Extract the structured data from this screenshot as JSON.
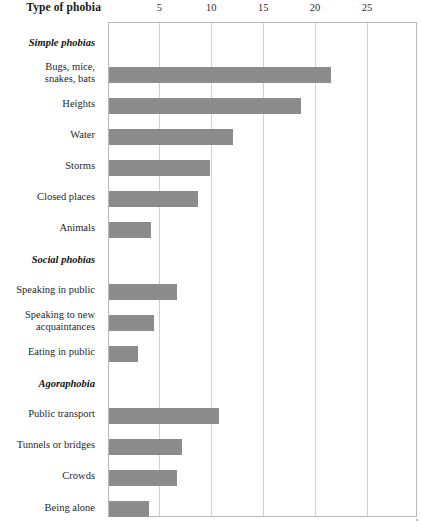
{
  "chart_data": {
    "type": "bar",
    "orientation": "horizontal",
    "title": "Type of phobia",
    "xlabel": "",
    "ylabel": "Type of phobia",
    "xlim": [
      0,
      29.8
    ],
    "ylim": null,
    "grid": true,
    "legend": null,
    "bar_color": "#8c8c8c",
    "axis_ticks": [
      5,
      10,
      15,
      20,
      25
    ],
    "tick_labels": [
      "5",
      "10",
      "15",
      "20",
      "25"
    ],
    "groups": [
      {
        "name": "Simple phobias",
        "categories": [
          "Bugs, mice, snakes, bats",
          "Heights",
          "Water",
          "Storms",
          "Closed places",
          "Animals"
        ],
        "values": [
          21.4,
          18.5,
          12.0,
          9.8,
          8.6,
          4.1
        ]
      },
      {
        "name": "Social phobias",
        "categories": [
          "Speaking in public",
          "Speaking to new acquaintances",
          "Eating in public"
        ],
        "values": [
          6.6,
          4.4,
          2.8
        ]
      },
      {
        "name": "Agoraphobia",
        "categories": [
          "Public transport",
          "Tunnels or bridges",
          "Crowds",
          "Being alone",
          "Going out by oneself"
        ],
        "values": [
          10.6,
          7.1,
          6.6,
          3.9,
          3.6
        ]
      }
    ],
    "categories": [
      "Bugs, mice, snakes, bats",
      "Heights",
      "Water",
      "Storms",
      "Closed places",
      "Animals",
      "Speaking in public",
      "Speaking to new acquaintances",
      "Eating in public",
      "Public transport",
      "Tunnels or bridges",
      "Crowds",
      "Being alone",
      "Going out by oneself"
    ],
    "values": [
      21.4,
      18.5,
      12.0,
      9.8,
      8.6,
      4.1,
      6.6,
      4.4,
      2.8,
      10.6,
      7.1,
      6.6,
      3.9,
      3.6
    ]
  },
  "axis": {
    "title": "Type of phobia",
    "ticks": [
      {
        "label": "5",
        "value": 5
      },
      {
        "label": "10",
        "value": 10
      },
      {
        "label": "15",
        "value": 15
      },
      {
        "label": "20",
        "value": 20
      },
      {
        "label": "25",
        "value": 25
      }
    ]
  },
  "rows": [
    {
      "kind": "group",
      "label": "Simple phobias"
    },
    {
      "kind": "bar",
      "label_lines": [
        "Bugs, mice,",
        "snakes, bats"
      ],
      "value": 21.4
    },
    {
      "kind": "bar",
      "label_lines": [
        "Heights"
      ],
      "value": 18.5
    },
    {
      "kind": "bar",
      "label_lines": [
        "Water"
      ],
      "value": 12.0
    },
    {
      "kind": "bar",
      "label_lines": [
        "Storms"
      ],
      "value": 9.8
    },
    {
      "kind": "bar",
      "label_lines": [
        "Closed places"
      ],
      "value": 8.6
    },
    {
      "kind": "bar",
      "label_lines": [
        "Animals"
      ],
      "value": 4.1
    },
    {
      "kind": "group",
      "label": "Social phobias"
    },
    {
      "kind": "bar",
      "label_lines": [
        "Speaking in public"
      ],
      "value": 6.6
    },
    {
      "kind": "bar",
      "label_lines": [
        "Speaking to new",
        "acquaintances"
      ],
      "value": 4.4
    },
    {
      "kind": "bar",
      "label_lines": [
        "Eating in public"
      ],
      "value": 2.8
    },
    {
      "kind": "group",
      "label": "Agoraphobia"
    },
    {
      "kind": "bar",
      "label_lines": [
        "Public transport"
      ],
      "value": 10.6
    },
    {
      "kind": "bar",
      "label_lines": [
        "Tunnels or bridges"
      ],
      "value": 7.1
    },
    {
      "kind": "bar",
      "label_lines": [
        "Crowds"
      ],
      "value": 6.6
    },
    {
      "kind": "bar",
      "label_lines": [
        "Being alone"
      ],
      "value": 3.9
    },
    {
      "kind": "bar",
      "label_lines": [
        "Going out by oneself"
      ],
      "value": 3.6
    }
  ],
  "layout": {
    "plot_left": 107.5,
    "plot_top": 22,
    "plot_width": 309.5,
    "plot_height": 495,
    "px_per_unit": 10.38,
    "row_pitch": 31.05,
    "first_row_center": 20.5,
    "bar_height": 16
  },
  "colors": {
    "bar": "#8c8c8c",
    "grid": "#cfcfcf",
    "frame": "#b9b9b9",
    "text": "#1a1a1a"
  }
}
